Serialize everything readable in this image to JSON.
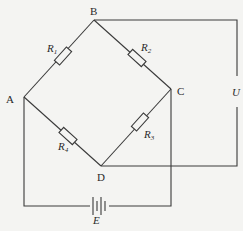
{
  "diagram": {
    "type": "wheatstone-bridge circuit",
    "nodes": [
      {
        "id": "A",
        "label": "A"
      },
      {
        "id": "B",
        "label": "B"
      },
      {
        "id": "C",
        "label": "C"
      },
      {
        "id": "D",
        "label": "D"
      }
    ],
    "resistors": [
      {
        "name": "R",
        "sub": "1",
        "between": "A-B"
      },
      {
        "name": "R",
        "sub": "2",
        "between": "B-C"
      },
      {
        "name": "R",
        "sub": "3",
        "between": "C-D"
      },
      {
        "name": "R",
        "sub": "4",
        "between": "A-D"
      }
    ],
    "source": {
      "label": "E",
      "between": "A-C"
    },
    "output": {
      "label": "U",
      "between": "B-D"
    }
  }
}
